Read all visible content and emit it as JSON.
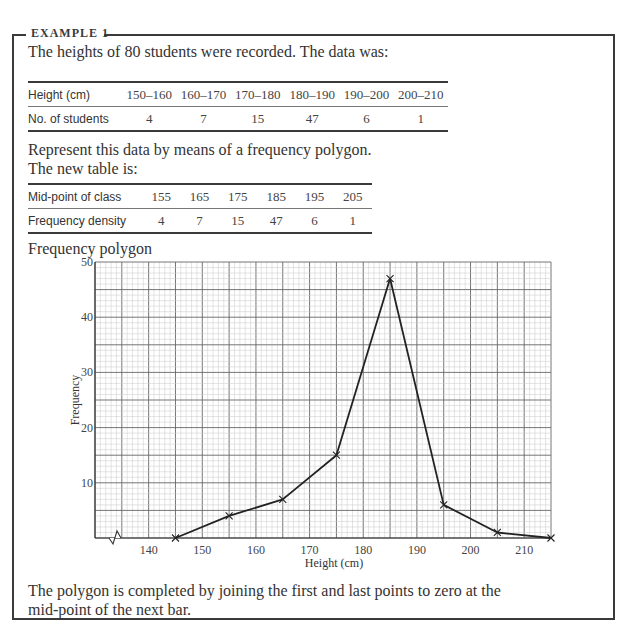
{
  "example": {
    "title": "EXAMPLE 1",
    "intro": "The heights of 80 students were recorded. The data was:",
    "table1": {
      "row_labels": [
        "Height (cm)",
        "No. of students"
      ],
      "classes": [
        "150–160",
        "160–170",
        "170–180",
        "180–190",
        "190–200",
        "200–210"
      ],
      "counts": [
        "4",
        "7",
        "15",
        "47",
        "6",
        "1"
      ]
    },
    "instruction": "Represent this data by means of a frequency polygon.",
    "new_table_intro": "The new table is:",
    "table2": {
      "row_labels": [
        "Mid-point of class",
        "Frequency density"
      ],
      "midpoints": [
        "155",
        "165",
        "175",
        "185",
        "195",
        "205"
      ],
      "values": [
        "4",
        "7",
        "15",
        "47",
        "6",
        "1"
      ]
    },
    "chart_caption": "Frequency polygon",
    "footer": "The polygon is completed by joining the first and last points to zero at the mid-point of the next bar."
  },
  "chart_data": {
    "type": "line",
    "title": "Frequency polygon",
    "xlabel": "Height (cm)",
    "ylabel": "Frequency",
    "x": [
      145,
      155,
      165,
      175,
      185,
      195,
      205,
      215
    ],
    "series": [
      {
        "name": "Frequency",
        "values": [
          0,
          4,
          7,
          15,
          47,
          6,
          1,
          0
        ],
        "marker": "x",
        "color": "#222222"
      }
    ],
    "xlim": [
      130,
      215
    ],
    "ylim": [
      0,
      50
    ],
    "x_ticks": [
      "140",
      "150",
      "160",
      "170",
      "180",
      "190",
      "200",
      "210"
    ],
    "y_ticks": [
      "10",
      "20",
      "30",
      "40",
      "50"
    ],
    "grid": true,
    "grid_style": "graph paper (major every 5 units x / 5 units y, minor every 1 unit)",
    "axis_break": "zig-zag on x-axis near origin",
    "legend": "none"
  }
}
